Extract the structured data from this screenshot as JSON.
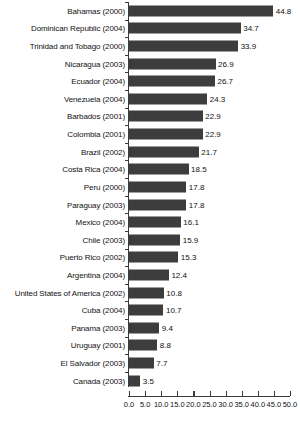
{
  "chart_data": {
    "type": "bar",
    "orientation": "horizontal",
    "title": "",
    "subtitle": "",
    "xlabel": "",
    "ylabel": "",
    "xlim": [
      0.0,
      50.0
    ],
    "xticks": [
      "0.0",
      "5.0",
      "10.0",
      "15.0",
      "20.0",
      "25.0",
      "30.0",
      "35.0",
      "40.0",
      "45.0",
      "50.0"
    ],
    "xtick_values": [
      0,
      5,
      10,
      15,
      20,
      25,
      30,
      35,
      40,
      45,
      50
    ],
    "grid": false,
    "legend": null,
    "bar_color": "#3d3d3d",
    "axis_color": "#3a3a3a",
    "categories": [
      "Bahamas (2000)",
      "Dominican Republic (2004)",
      "Trinidad and Tobago (2000)",
      "Nicaragua (2003)",
      "Ecuador (2004)",
      "Venezuela (2004)",
      "Barbados (2001)",
      "Colombia (2001)",
      "Brazil (2002)",
      "Costa Rica (2004)",
      "Peru (2000)",
      "Paraguay (2003)",
      "Mexico (2004)",
      "Chile (2003)",
      "Puerto Rico (2002)",
      "Argentina (2004)",
      "United States of America (2002)",
      "Cuba (2004)",
      "Panama (2003)",
      "Uruguay (2001)",
      "El Salvador (2003)",
      "Canada (2003)"
    ],
    "values": [
      44.8,
      34.7,
      33.9,
      26.9,
      26.7,
      24.3,
      22.9,
      22.9,
      21.7,
      18.5,
      17.8,
      17.8,
      16.1,
      15.9,
      15.3,
      12.4,
      10.8,
      10.7,
      9.4,
      8.8,
      7.7,
      3.5
    ],
    "value_labels": [
      "44.8",
      "34.7",
      "33.9",
      "26.9",
      "26.7",
      "24.3",
      "22.9",
      "22.9",
      "21.7",
      "18.5",
      "17.8",
      "17.8",
      "16.1",
      "15.9",
      "15.3",
      "12.4",
      "10.8",
      "10.7",
      "9.4",
      "8.8",
      "7.7",
      "3.5"
    ]
  }
}
